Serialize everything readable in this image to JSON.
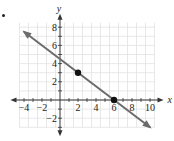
{
  "chart_data": {
    "type": "line",
    "title": "",
    "xlabel": "x",
    "ylabel": "y",
    "xlim": [
      -4.5,
      10.5
    ],
    "ylim": [
      -3,
      8.5
    ],
    "grid": true,
    "x_ticks": [
      -4,
      -2,
      2,
      4,
      6,
      8,
      10
    ],
    "y_ticks": [
      -2,
      2,
      4,
      6,
      8
    ],
    "x_tick_labels": [
      "−4",
      "−2",
      "2",
      "4",
      "6",
      "8",
      "10"
    ],
    "y_tick_labels": [
      "−2",
      "2",
      "4",
      "6",
      "8"
    ],
    "series": [
      {
        "name": "line",
        "equation": "y = -3/4 x + 9/2",
        "slope": -0.75,
        "intercept": 4.5,
        "x": [
          -4,
          10
        ],
        "y": [
          7.5,
          -3
        ],
        "arrows_both_ends": true
      }
    ],
    "points": [
      {
        "x": 2,
        "y": 3
      },
      {
        "x": 6,
        "y": 0
      }
    ],
    "colors": {
      "line": "#6b6b6b",
      "grid": "#e2e2e2",
      "axis": "#333333",
      "point": "#111111"
    }
  },
  "labels": {
    "x_axis": "x",
    "y_axis": "y"
  }
}
